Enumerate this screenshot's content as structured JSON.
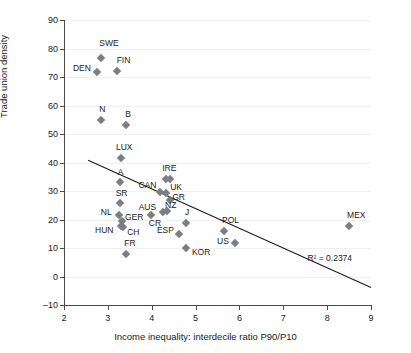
{
  "chart_data": {
    "type": "scatter",
    "title": "",
    "xlabel": "Income inequality: interdecile ratio P90/P10",
    "ylabel": "Trade union density",
    "xlim": [
      2,
      9
    ],
    "ylim": [
      -10,
      90
    ],
    "xticks": [
      2,
      3,
      4,
      5,
      6,
      7,
      8,
      9
    ],
    "yticks": [
      -10,
      0,
      10,
      20,
      30,
      40,
      50,
      60,
      70,
      80,
      90
    ],
    "grid": "horizontal",
    "legend": "none",
    "annotations": [
      {
        "name": "r-squared",
        "text": "R² = 0.2374",
        "x": 7.55,
        "y": 6.5
      }
    ],
    "trendline": {
      "type": "linear",
      "x_start": 2.55,
      "y_start": 40.8,
      "x_end": 9.0,
      "y_end": -3.9,
      "r_squared": 0.2374
    },
    "points": [
      {
        "label": "SWE",
        "x": 2.85,
        "y": 76.5,
        "lx": -2,
        "ly": -15
      },
      {
        "label": "FIN",
        "x": 3.2,
        "y": 72.2,
        "lx": 0,
        "ly": -11
      },
      {
        "label": "DEN",
        "x": 2.75,
        "y": 71.6,
        "lx": -24,
        "ly": -4
      },
      {
        "label": "N",
        "x": 2.85,
        "y": 54.8,
        "lx": -2,
        "ly": -11
      },
      {
        "label": "B",
        "x": 3.42,
        "y": 53.1,
        "lx": -1,
        "ly": -11
      },
      {
        "label": "LUX",
        "x": 3.3,
        "y": 41.6,
        "lx": -5,
        "ly": -11
      },
      {
        "label": "A",
        "x": 3.27,
        "y": 33.0,
        "lx": -2,
        "ly": -10
      },
      {
        "label": "IRE",
        "x": 4.33,
        "y": 34.2,
        "lx": -4,
        "ly": -11
      },
      {
        "label": "IRE2",
        "x": 4.42,
        "y": 34.1,
        "lx": 0,
        "ly": 0
      },
      {
        "label": "CAN",
        "x": 4.2,
        "y": 29.6,
        "lx": -22,
        "ly": -7
      },
      {
        "label": "UK",
        "x": 4.33,
        "y": 29.2,
        "lx": 4,
        "ly": -6
      },
      {
        "label": "SR",
        "x": 3.27,
        "y": 25.8,
        "lx": -4,
        "ly": -10
      },
      {
        "label": "GR",
        "x": 4.42,
        "y": 26.8,
        "lx": 2,
        "ly": -3
      },
      {
        "label": "NZ",
        "x": 4.35,
        "y": 23.0,
        "lx": -2,
        "ly": -6
      },
      {
        "label": "AUS",
        "x": 4.25,
        "y": 22.7,
        "lx": -24,
        "ly": -5
      },
      {
        "label": "NL",
        "x": 3.25,
        "y": 21.5,
        "lx": -18,
        "ly": -3
      },
      {
        "label": "GER",
        "x": 3.32,
        "y": 19.4,
        "lx": 3,
        "ly": -4
      },
      {
        "label": "HUN",
        "x": 3.3,
        "y": 17.6,
        "lx": -26,
        "ly": 4
      },
      {
        "label": "CH",
        "x": 3.35,
        "y": 17.5,
        "lx": 4,
        "ly": 5
      },
      {
        "label": "CR",
        "x": 3.98,
        "y": 21.6,
        "lx": -2,
        "ly": 8
      },
      {
        "label": "ESP",
        "x": 4.62,
        "y": 14.8,
        "lx": -22,
        "ly": -4
      },
      {
        "label": "J",
        "x": 4.78,
        "y": 18.6,
        "lx": -1,
        "ly": -11
      },
      {
        "label": "FR",
        "x": 3.42,
        "y": 7.9,
        "lx": -2,
        "ly": -11
      },
      {
        "label": "KOR",
        "x": 4.78,
        "y": 10.0,
        "lx": 6,
        "ly": 4
      },
      {
        "label": "POL",
        "x": 5.65,
        "y": 15.8,
        "lx": -2,
        "ly": -11
      },
      {
        "label": "US",
        "x": 5.9,
        "y": 11.6,
        "lx": -18,
        "ly": -2
      },
      {
        "label": "MEX",
        "x": 8.5,
        "y": 17.6,
        "lx": -2,
        "ly": -11
      }
    ]
  }
}
